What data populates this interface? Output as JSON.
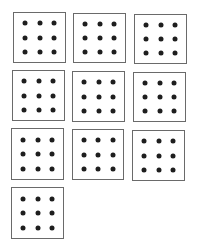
{
  "diagram": {
    "colors": {
      "border": "#6a6a6a",
      "dot": "#1e1e1e",
      "background": "#ffffff"
    },
    "dot_grid": {
      "rows": 3,
      "cols": 3
    },
    "boxes": [
      {
        "x": 13,
        "y": 12,
        "w": 53,
        "h": 51
      },
      {
        "x": 73,
        "y": 13,
        "w": 53,
        "h": 50
      },
      {
        "x": 134,
        "y": 14,
        "w": 53,
        "h": 50
      },
      {
        "x": 12,
        "y": 70,
        "w": 53,
        "h": 51
      },
      {
        "x": 72,
        "y": 71,
        "w": 53,
        "h": 51
      },
      {
        "x": 133,
        "y": 72,
        "w": 53,
        "h": 50
      },
      {
        "x": 11,
        "y": 128,
        "w": 53,
        "h": 52
      },
      {
        "x": 72,
        "y": 129,
        "w": 52,
        "h": 51
      },
      {
        "x": 132,
        "y": 130,
        "w": 53,
        "h": 51
      },
      {
        "x": 11,
        "y": 187,
        "w": 53,
        "h": 52
      }
    ]
  }
}
